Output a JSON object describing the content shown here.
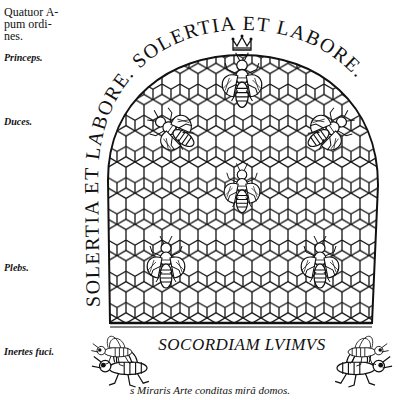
{
  "margin_notes": {
    "heading": [
      "Quatuor A-",
      "pum ordi-",
      "nes."
    ],
    "labels": [
      {
        "text": "Princeps.",
        "top": 52
      },
      {
        "text": "Duces.",
        "top": 116
      },
      {
        "text": "Plebs.",
        "top": 262
      },
      {
        "text": "Inertes fuci.",
        "top": 346
      }
    ]
  },
  "engraving": {
    "motto_arc": "SOLERTIA ET LABORE. SOLERTIA ET LABORE.",
    "motto_left": "SOLERTIA  ET",
    "motto_top": "LABORE · SOLERTIA",
    "motto_right": "ET  LABORE.",
    "banner": "SOCORDIAM LVIMVS",
    "bees": [
      {
        "role": "queen-crowned",
        "x": 242,
        "y": 85
      },
      {
        "role": "leader",
        "x": 170,
        "y": 130
      },
      {
        "role": "leader",
        "x": 330,
        "y": 130
      },
      {
        "role": "worker",
        "x": 242,
        "y": 190
      },
      {
        "role": "worker",
        "x": 165,
        "y": 262
      },
      {
        "role": "worker",
        "x": 320,
        "y": 262
      }
    ],
    "drones": [
      {
        "side": "left",
        "x": 122,
        "y": 350
      },
      {
        "side": "right",
        "x": 362,
        "y": 350
      }
    ]
  },
  "caption": "s Miraris Arte conditas mirâ domos."
}
